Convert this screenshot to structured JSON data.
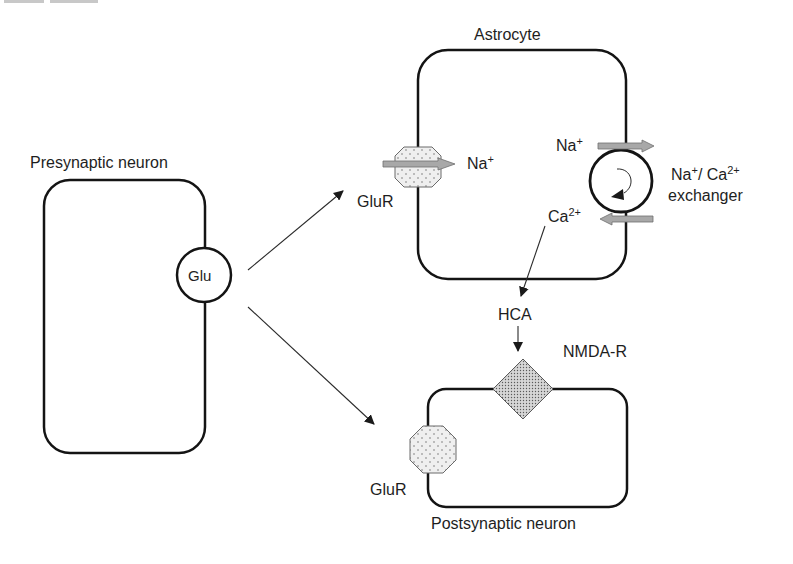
{
  "colors": {
    "line": "#141414",
    "arrow": "#1a1a1a",
    "gray_arrow_fill": "#a8a8a8",
    "gray_arrow_stroke": "#6e6e6e",
    "receptor_fill": "#ececec",
    "nmda_fill": "#c4c4c4",
    "background": "#ffffff"
  },
  "cells": {
    "presynaptic": {
      "label": "Presynaptic neuron"
    },
    "astrocyte": {
      "label": "Astrocyte"
    },
    "postsynaptic": {
      "label": "Postsynaptic neuron"
    }
  },
  "molecules": {
    "glu": "Glu",
    "glur_astro": "GluR",
    "glur_post": "GluR",
    "na_influx": {
      "base": "Na",
      "sup": "+"
    },
    "na_out": {
      "base": "Na",
      "sup": "+"
    },
    "ca_in": {
      "base": "Ca",
      "sup": "2+"
    },
    "exchanger": {
      "line1_a": "Na",
      "line1_a_sup": "+",
      "line1_sep": "/ ",
      "line1_b": "Ca",
      "line1_b_sup": "2+",
      "line2": "exchanger"
    },
    "hca": "HCA",
    "nmda": "NMDA-R"
  }
}
